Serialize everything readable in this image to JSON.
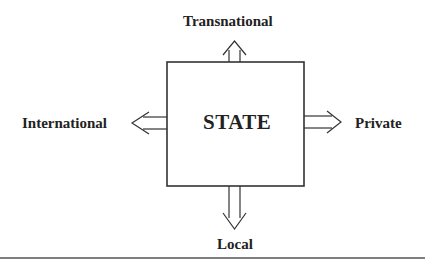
{
  "diagram": {
    "center": {
      "label": "STATE"
    },
    "directions": {
      "up": {
        "label": "Transnational"
      },
      "left": {
        "label": "International"
      },
      "right": {
        "label": "Private"
      },
      "down": {
        "label": "Local"
      }
    },
    "colors": {
      "stroke": "#333333",
      "text": "#222222",
      "background": "#ffffff"
    }
  }
}
